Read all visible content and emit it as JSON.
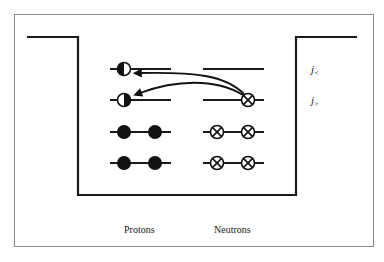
{
  "figure": {
    "type": "nuclear shell-model schematic (square potential well)",
    "colors": {
      "ink": "#1a1a1a",
      "frame": "#8a8a8a",
      "background": "#ffffff",
      "neutron_fill": "#ffffff",
      "proton_fill": "#111111"
    },
    "columns": {
      "protons_label": "Protons",
      "neutrons_label": "Neutrons"
    },
    "level_labels": {
      "upper": "j<",
      "lower": "j>",
      "upper_base": "j",
      "upper_sub": "<",
      "lower_base": "j",
      "lower_sub": ">"
    },
    "levels": [
      {
        "name": "j<",
        "protons": [
          "half-filled"
        ],
        "neutrons": []
      },
      {
        "name": "j>",
        "protons": [
          "half-filled"
        ],
        "neutrons": [
          "crossed"
        ]
      },
      {
        "name": "level-3",
        "protons": [
          "filled",
          "filled"
        ],
        "neutrons": [
          "crossed",
          "crossed"
        ]
      },
      {
        "name": "level-4",
        "protons": [
          "filled",
          "filled"
        ],
        "neutrons": [
          "crossed",
          "crossed"
        ]
      }
    ],
    "transitions": [
      {
        "from": "neutron j>",
        "to": "proton j<",
        "icon": "arrow-icon"
      },
      {
        "from": "neutron j>",
        "to": "proton j>",
        "icon": "arrow-icon"
      }
    ]
  }
}
